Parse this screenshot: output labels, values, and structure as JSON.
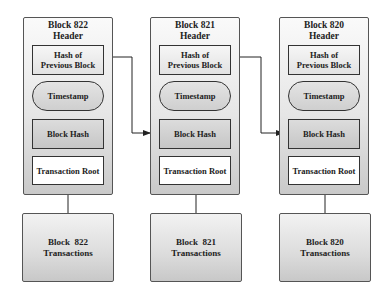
{
  "diagram": {
    "blocks": [
      {
        "header_title_line1": "Block 822",
        "header_title_line2": "Header",
        "hash_prev_line1": "Hash of",
        "hash_prev_line2": "Previous Block",
        "timestamp": "Timestamp",
        "block_hash": "Block Hash",
        "transaction_root": "Transaction Root",
        "transactions_line1": "Block  822",
        "transactions_line2": "Transactions"
      },
      {
        "header_title_line1": "Block 821",
        "header_title_line2": "Header",
        "hash_prev_line1": "Hash of",
        "hash_prev_line2": "Previous Block",
        "timestamp": "Timestamp",
        "block_hash": "Block Hash",
        "transaction_root": "Transaction Root",
        "transactions_line1": "Block  821",
        "transactions_line2": "Transactions"
      },
      {
        "header_title_line1": "Block 820",
        "header_title_line2": "Header",
        "hash_prev_line1": "Hash of",
        "hash_prev_line2": "Previous Block",
        "timestamp": "Timestamp",
        "block_hash": "Block Hash",
        "transaction_root": "Transaction Root",
        "transactions_line1": "Block 820",
        "transactions_line2": "Transactions"
      }
    ],
    "links": [
      {
        "from": "Block 822 Hash of Previous Block",
        "to": "Block 821 Block Hash"
      },
      {
        "from": "Block 821 Hash of Previous Block",
        "to": "Block 820 Block Hash"
      },
      {
        "from": "Block 822 Transactions",
        "to": "Block 822 Transaction Root"
      },
      {
        "from": "Block 821 Transactions",
        "to": "Block 821 Transaction Root"
      },
      {
        "from": "Block 820 Transactions",
        "to": "Block 820 Transaction Root"
      }
    ]
  }
}
